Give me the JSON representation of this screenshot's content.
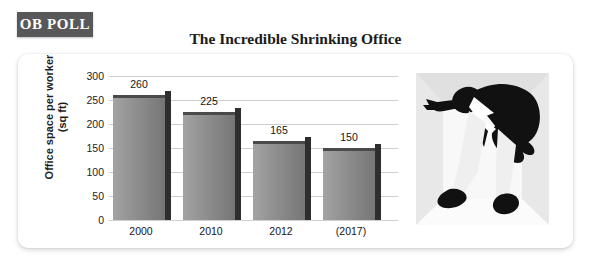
{
  "badge": {
    "label": "OB POLL",
    "color": "#58585a",
    "text_color": "#ffffff"
  },
  "title": "The Incredible Shrinking Office",
  "axes": {
    "y_title_line1": "Office space per worker",
    "y_title_line2": "(sq ft)",
    "y_ticks": [
      "300",
      "250",
      "200",
      "150",
      "100",
      "50",
      "0"
    ]
  },
  "illustration": {
    "alt": "stylized silhouette of a businessman crouching inside a tiny room",
    "wall_color": "#e2e2e2",
    "floor_color": "#f7f7f7",
    "figure_color": "#111111"
  },
  "chart_data": {
    "type": "bar",
    "title": "The Incredible Shrinking Office",
    "xlabel": "",
    "ylabel": "Office space per worker (sq ft)",
    "categories": [
      "2000",
      "2010",
      "2012",
      "(2017)"
    ],
    "values": [
      260,
      225,
      165,
      150
    ],
    "value_labels": [
      "260",
      "225",
      "165",
      "150"
    ],
    "ylim": [
      0,
      300
    ],
    "ytick_step": 50,
    "yticks": [
      0,
      50,
      100,
      150,
      200,
      250,
      300
    ],
    "grid": true,
    "legend": false,
    "bar_color": "#8e8e8e",
    "bar_side_color": "#2e2e2e",
    "gridline_color": "#cfcfcf"
  }
}
